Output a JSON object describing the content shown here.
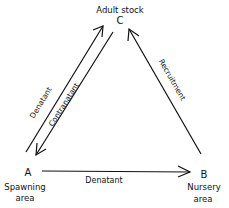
{
  "nodes": {
    "C": {
      "letter": "C",
      "label": "Adult stock"
    },
    "A": {
      "letter": "A",
      "label_line1": "Spawning",
      "label_line2": "area"
    },
    "B": {
      "letter": "B",
      "label_line1": "Nursery",
      "label_line2": "area"
    }
  },
  "edges": {
    "a_to_c": {
      "label": "Denatant",
      "from": "A",
      "to": "C"
    },
    "c_to_a": {
      "label": "Contranatant",
      "from": "C",
      "to": "A"
    },
    "b_to_c": {
      "label": "Recruitment",
      "from": "B",
      "to": "C"
    },
    "a_to_b": {
      "label": "Denatant",
      "from": "A",
      "to": "B"
    }
  },
  "colors": {
    "ink": "#111111",
    "background": "#ffffff"
  }
}
